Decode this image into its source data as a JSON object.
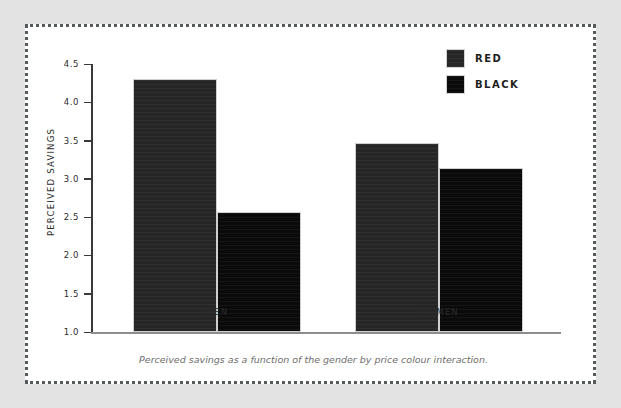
{
  "figure": {
    "caption": "Perceived savings as a function of the gender by price colour interaction.",
    "frame_color": "#555a5d",
    "page_background": "#e3e3e3",
    "panel_background": "#ffffff"
  },
  "legend": {
    "position": "top-right",
    "items": [
      {
        "label": "RED",
        "color": "#262626",
        "swatch_name": "legend-swatch-red"
      },
      {
        "label": "BLACK",
        "color": "#0a0a0a",
        "swatch_name": "legend-swatch-black"
      }
    ]
  },
  "chart_data": {
    "type": "bar",
    "title": "",
    "subtitle": "",
    "xlabel": "",
    "ylabel": "PERCEIVED SAVINGS",
    "categories": [
      "MEN",
      "WOMEN"
    ],
    "series": [
      {
        "name": "RED",
        "color": "#262626",
        "values": [
          4.3,
          3.47
        ]
      },
      {
        "name": "BLACK",
        "color": "#0a0a0a",
        "values": [
          2.57,
          3.14
        ]
      }
    ],
    "ylim": [
      1.0,
      4.5
    ],
    "ytick_labels": [
      "4.5",
      "4.0",
      "3.5",
      "3.0",
      "2.5",
      "2.0",
      "1.5",
      "1.0"
    ],
    "ytick_values": [
      4.5,
      4.0,
      3.5,
      3.0,
      2.5,
      2.0,
      1.5,
      1.0
    ],
    "grid": false,
    "legend_position": "top-right",
    "annotations": [
      "Perceived savings as a function of the gender by price colour interaction."
    ]
  }
}
